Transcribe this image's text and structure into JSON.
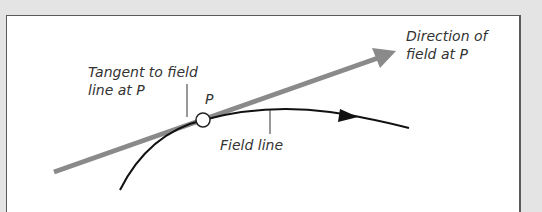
{
  "diagram": {
    "labels": {
      "tangent": "Tangent to field\nline at P",
      "point": "P",
      "field_line": "Field line",
      "direction": "Direction of\nfield at P"
    },
    "colors": {
      "tangent_arrow": "#8a8a8a",
      "field_line": "#111111",
      "background": "#e4e4e4",
      "panel": "#ffffff"
    }
  }
}
